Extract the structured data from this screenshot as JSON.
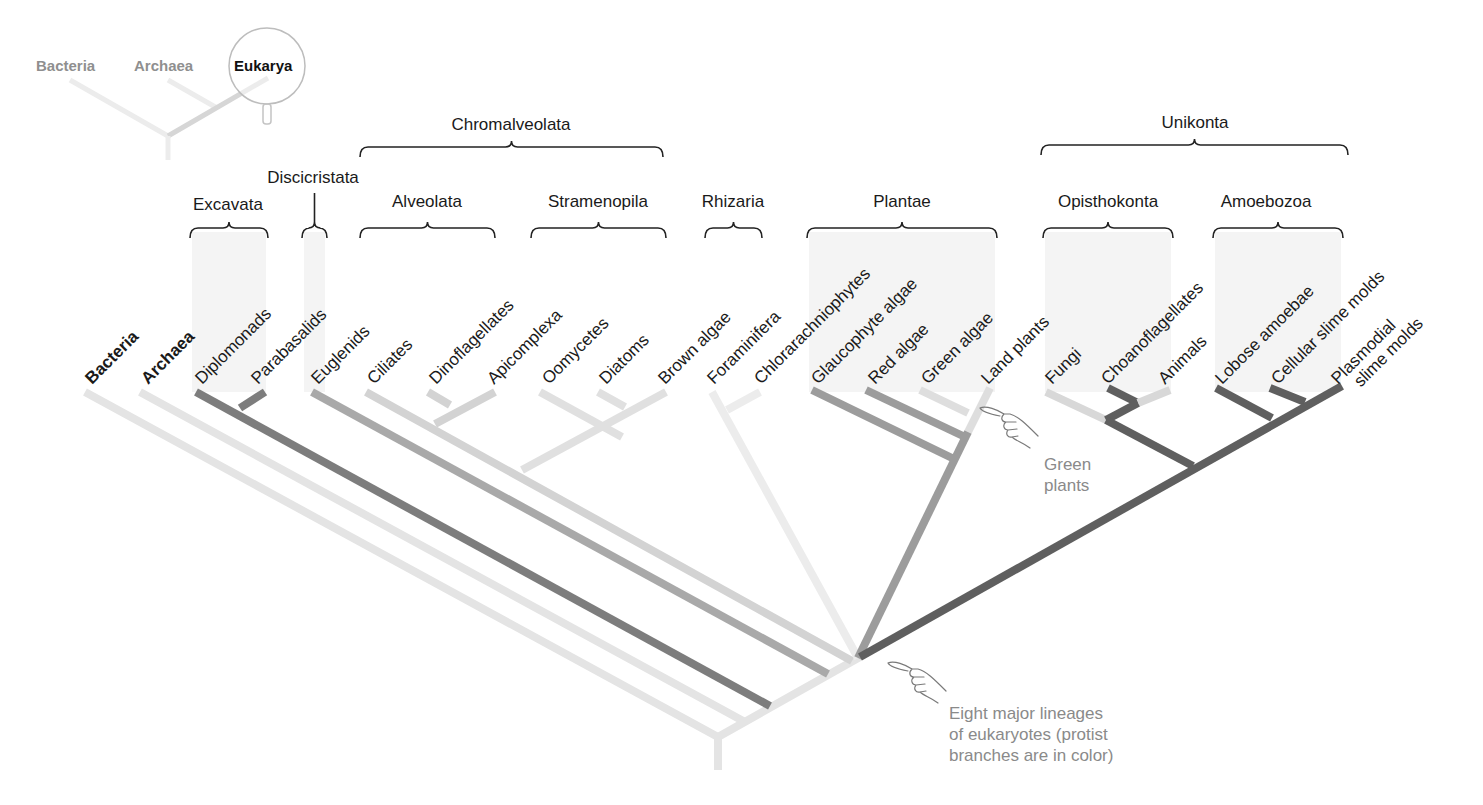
{
  "inset": {
    "labels": [
      {
        "text": "Bacteria",
        "x": 36,
        "y": 71,
        "active": false
      },
      {
        "text": "Archaea",
        "x": 134,
        "y": 71,
        "active": false
      },
      {
        "text": "Eukarya",
        "x": 234,
        "y": 71,
        "active": true
      }
    ],
    "magnifier": {
      "cx": 267,
      "cy": 66,
      "r": 38
    },
    "branches": [
      {
        "x1": 70,
        "y1": 80,
        "x2": 168,
        "y2": 136,
        "color": "#ececec"
      },
      {
        "x1": 168,
        "y1": 80,
        "x2": 217,
        "y2": 108,
        "color": "#ececec"
      },
      {
        "x1": 268,
        "y1": 78,
        "x2": 168,
        "y2": 136,
        "color": "#d6d6d6"
      },
      {
        "x1": 168,
        "y1": 136,
        "x2": 168,
        "y2": 160,
        "color": "#ececec"
      }
    ]
  },
  "supergroups": [
    {
      "label": "Chromalveolata",
      "x1": 360,
      "x2": 663,
      "y": 147,
      "label_x": 511,
      "label_y": 130
    },
    {
      "label": "Unikonta",
      "x1": 1041,
      "x2": 1348,
      "y": 145,
      "label_x": 1195,
      "label_y": 128
    }
  ],
  "groups": [
    {
      "label": "Excavata",
      "x1": 190,
      "x2": 268,
      "y": 228,
      "label_x": 228,
      "label_y": 210,
      "shade": true,
      "shade_x1": 192,
      "shade_x2": 266
    },
    {
      "label": "Discicristata",
      "x1": 302,
      "x2": 327,
      "y": 228,
      "label_x": 313,
      "label_y": 183,
      "stem": true,
      "shade": true,
      "shade_x1": 304,
      "shade_x2": 325
    },
    {
      "label": "Alveolata",
      "x1": 360,
      "x2": 495,
      "y": 228,
      "label_x": 427,
      "label_y": 207,
      "shade": false
    },
    {
      "label": "Stramenopila",
      "x1": 531,
      "x2": 666,
      "y": 228,
      "label_x": 598,
      "label_y": 207,
      "shade": false
    },
    {
      "label": "Rhizaria",
      "x1": 705,
      "x2": 762,
      "y": 228,
      "label_x": 733,
      "label_y": 207,
      "shade": false
    },
    {
      "label": "Plantae",
      "x1": 807,
      "x2": 997,
      "y": 228,
      "label_x": 902,
      "label_y": 207,
      "shade": true,
      "shade_x1": 809,
      "shade_x2": 995
    },
    {
      "label": "Opisthokonta",
      "x1": 1043,
      "x2": 1173,
      "y": 228,
      "label_x": 1108,
      "label_y": 207,
      "shade": true,
      "shade_x1": 1045,
      "shade_x2": 1171
    },
    {
      "label": "Amoebozoa",
      "x1": 1213,
      "x2": 1343,
      "y": 228,
      "label_x": 1266,
      "label_y": 207,
      "shade": true,
      "shade_x1": 1215,
      "shade_x2": 1341
    }
  ],
  "tips": [
    {
      "label": "Bacteria",
      "x": 92,
      "y": 385,
      "bold": true
    },
    {
      "label": "Archaea",
      "x": 148,
      "y": 385,
      "bold": true
    },
    {
      "label": "Diplomonads",
      "x": 202,
      "y": 385
    },
    {
      "label": "Parabasalids",
      "x": 258,
      "y": 385
    },
    {
      "label": "Euglenids",
      "x": 318,
      "y": 385
    },
    {
      "label": "Ciliates",
      "x": 374,
      "y": 385
    },
    {
      "label": "Dinoflagellates",
      "x": 436,
      "y": 385
    },
    {
      "label": "Apicomplexa",
      "x": 494,
      "y": 385
    },
    {
      "label": "Oomycetes",
      "x": 549,
      "y": 385
    },
    {
      "label": "Diatoms",
      "x": 606,
      "y": 385
    },
    {
      "label": "Brown algae",
      "x": 665,
      "y": 385
    },
    {
      "label": "Foraminifera",
      "x": 714,
      "y": 385
    },
    {
      "label": "Chlorarachniophytes",
      "x": 761,
      "y": 385
    },
    {
      "label": "Glaucophyte algae",
      "x": 818,
      "y": 385
    },
    {
      "label": "Red algae",
      "x": 875,
      "y": 385
    },
    {
      "label": "Green algae",
      "x": 928,
      "y": 385
    },
    {
      "label": "Land plants",
      "x": 988,
      "y": 385
    },
    {
      "label": "Fungi",
      "x": 1052,
      "y": 385
    },
    {
      "label": "Choanoflagellates",
      "x": 1108,
      "y": 385
    },
    {
      "label": "Animals",
      "x": 1165,
      "y": 385
    },
    {
      "label": "Lobose amoebae",
      "x": 1222,
      "y": 385
    },
    {
      "label": "Cellular slime molds",
      "x": 1278,
      "y": 385
    },
    {
      "label": "Plasmodial",
      "x": 1338,
      "y": 385,
      "line2": "slime molds"
    }
  ],
  "branches": [
    {
      "name": "bacteria",
      "x1": 85,
      "y1": 392,
      "x2": 718,
      "y2": 737,
      "color": "#e4e4e4"
    },
    {
      "name": "archaea",
      "x1": 140,
      "y1": 392,
      "x2": 745,
      "y2": 722,
      "color": "#e4e4e4"
    },
    {
      "name": "root-trunk",
      "x1": 718,
      "y1": 737,
      "x2": 718,
      "y2": 770,
      "color": "#e4e4e4"
    },
    {
      "name": "eukarya-stem",
      "x1": 718,
      "y1": 737,
      "x2": 860,
      "y2": 657,
      "color": "#e4e4e4"
    },
    {
      "name": "excavata",
      "x1": 196,
      "y1": 392,
      "x2": 770,
      "y2": 706,
      "color": "#7d7d7d"
    },
    {
      "name": "parabasalids",
      "x1": 265,
      "y1": 392,
      "x2": 240,
      "y2": 408,
      "color": "#7d7d7d"
    },
    {
      "name": "euglenids",
      "x1": 312,
      "y1": 392,
      "x2": 828,
      "y2": 674,
      "color": "#a9a9a9"
    },
    {
      "name": "chromalveolata",
      "x1": 366,
      "y1": 392,
      "x2": 852,
      "y2": 661,
      "color": "#d3d3d3"
    },
    {
      "name": "dinoflagellates",
      "x1": 428,
      "y1": 392,
      "x2": 450,
      "y2": 405,
      "color": "#d3d3d3"
    },
    {
      "name": "alveolata-join",
      "x1": 495,
      "y1": 392,
      "x2": 435,
      "y2": 424,
      "color": "#d3d3d3"
    },
    {
      "name": "oomycetes",
      "x1": 540,
      "y1": 392,
      "x2": 622,
      "y2": 437,
      "color": "#e0e0e0"
    },
    {
      "name": "diatoms",
      "x1": 598,
      "y1": 392,
      "x2": 625,
      "y2": 407,
      "color": "#e0e0e0"
    },
    {
      "name": "stramenopila",
      "x1": 666,
      "y1": 392,
      "x2": 522,
      "y2": 470,
      "color": "#e0e0e0"
    },
    {
      "name": "rhizaria",
      "x1": 712,
      "y1": 392,
      "x2": 858,
      "y2": 658,
      "color": "#ececec"
    },
    {
      "name": "chlorarachniophytes",
      "x1": 760,
      "y1": 392,
      "x2": 727,
      "y2": 410,
      "color": "#ececec"
    },
    {
      "name": "glaucophyte",
      "x1": 812,
      "y1": 390,
      "x2": 952,
      "y2": 458,
      "color": "#9c9c9c"
    },
    {
      "name": "red-algae",
      "x1": 866,
      "y1": 390,
      "x2": 963,
      "y2": 436,
      "color": "#9c9c9c"
    },
    {
      "name": "green-algae",
      "x1": 920,
      "y1": 390,
      "x2": 968,
      "y2": 413,
      "color": "#dedede"
    },
    {
      "name": "land-plants",
      "x1": 990,
      "y1": 388,
      "x2": 968,
      "y2": 432,
      "color": "#dedede"
    },
    {
      "name": "plantae-stem",
      "x1": 968,
      "y1": 432,
      "x2": 858,
      "y2": 658,
      "color": "#9c9c9c"
    },
    {
      "name": "fungi",
      "x1": 1046,
      "y1": 392,
      "x2": 1106,
      "y2": 420,
      "color": "#d8d8d8"
    },
    {
      "name": "choanoflagellates",
      "x1": 1108,
      "y1": 388,
      "x2": 1138,
      "y2": 403,
      "color": "#5f5f5f"
    },
    {
      "name": "animals",
      "x1": 1170,
      "y1": 390,
      "x2": 1138,
      "y2": 403,
      "color": "#d8d8d8"
    },
    {
      "name": "animal-choano-join",
      "x1": 1138,
      "y1": 403,
      "x2": 1106,
      "y2": 420,
      "color": "#5f5f5f"
    },
    {
      "name": "opisthokonta",
      "x1": 1106,
      "y1": 420,
      "x2": 1193,
      "y2": 466,
      "color": "#5f5f5f"
    },
    {
      "name": "lobose",
      "x1": 1216,
      "y1": 388,
      "x2": 1272,
      "y2": 418,
      "color": "#5f5f5f"
    },
    {
      "name": "cellular",
      "x1": 1270,
      "y1": 388,
      "x2": 1305,
      "y2": 402,
      "color": "#5f5f5f"
    },
    {
      "name": "unikonta-stem",
      "x1": 1342,
      "y1": 386,
      "x2": 860,
      "y2": 657,
      "color": "#5f5f5f"
    }
  ],
  "annotations": [
    {
      "name": "green-plants-note",
      "lines": [
        "Green",
        "plants"
      ],
      "x": 1044,
      "y": 470,
      "hand": {
        "x": 980,
        "y": 408
      }
    },
    {
      "name": "eight-lineages-note",
      "lines": [
        "Eight major lineages",
        "of eukaryotes (protist",
        "branches are in color)"
      ],
      "x": 949,
      "y": 719,
      "hand": {
        "x": 888,
        "y": 663
      }
    }
  ]
}
